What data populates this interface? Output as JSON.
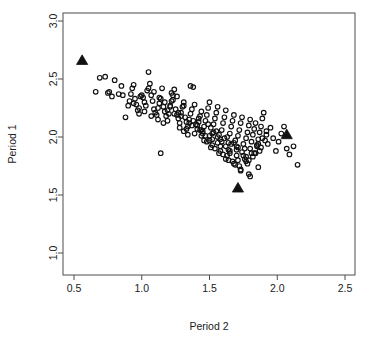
{
  "figure": {
    "background": "#ffffff",
    "frame_color": "#4d4d4d",
    "point_color": "#111111"
  },
  "chart_data": {
    "type": "scatter",
    "title": "",
    "xlabel": "Period 2",
    "ylabel": "Period 1",
    "xlim": [
      0.38,
      2.58
    ],
    "ylim": [
      0.92,
      3.08
    ],
    "xticks": [
      0.5,
      1.0,
      1.5,
      2.0,
      2.5
    ],
    "yticks": [
      1.0,
      1.5,
      2.0,
      2.5,
      3.0
    ],
    "xticklabels": [
      "0.5",
      "1.0",
      "1.5",
      "2.0",
      "2.5"
    ],
    "yticklabels": [
      "1.0",
      "1.5",
      "2.0",
      "2.5",
      "3.0"
    ],
    "grid": false,
    "legend": null,
    "series": [
      {
        "name": "observations",
        "marker": "open-circle",
        "marker_size": 4.6,
        "x": [
          0.66,
          0.69,
          0.73,
          0.75,
          0.76,
          0.78,
          0.8,
          0.83,
          0.85,
          0.86,
          0.88,
          0.9,
          0.91,
          0.92,
          0.93,
          0.94,
          0.95,
          0.96,
          0.97,
          0.98,
          0.99,
          1.0,
          1.01,
          1.02,
          1.03,
          1.04,
          1.05,
          1.06,
          1.07,
          1.08,
          1.09,
          1.1,
          1.11,
          1.12,
          1.13,
          1.14,
          1.15,
          1.16,
          1.17,
          1.18,
          1.19,
          1.2,
          1.21,
          1.22,
          1.23,
          1.24,
          1.25,
          1.26,
          1.27,
          1.28,
          1.29,
          1.3,
          1.31,
          1.32,
          1.33,
          1.34,
          1.35,
          1.36,
          1.37,
          1.38,
          1.39,
          1.4,
          1.41,
          1.42,
          1.43,
          1.44,
          1.45,
          1.46,
          1.47,
          1.48,
          1.49,
          1.5,
          1.51,
          1.52,
          1.53,
          1.54,
          1.55,
          1.56,
          1.57,
          1.58,
          1.59,
          1.6,
          1.61,
          1.62,
          1.63,
          1.64,
          1.65,
          1.66,
          1.67,
          1.68,
          1.69,
          1.7,
          1.71,
          1.72,
          1.73,
          1.74,
          1.75,
          1.76,
          1.77,
          1.78,
          1.79,
          1.8,
          1.81,
          1.82,
          1.83,
          1.84,
          1.85,
          1.86,
          1.87,
          1.88,
          1.89,
          1.9,
          1.91,
          1.92,
          1.93,
          1.95,
          1.97,
          1.99,
          2.01,
          2.03,
          2.05,
          2.07,
          2.09,
          2.12,
          2.15,
          1.14,
          1.36,
          1.05,
          1.22,
          1.26,
          0.94,
          0.98,
          1.02,
          1.07,
          1.12,
          1.16,
          1.19,
          1.24,
          1.28,
          1.31,
          1.34,
          1.38,
          1.41,
          1.44,
          1.47,
          1.5,
          1.53,
          1.56,
          1.59,
          1.62,
          1.65,
          1.68,
          1.71,
          1.74,
          1.77,
          1.8,
          1.83,
          1.86,
          1.89,
          1.92,
          1.23,
          1.31,
          1.42,
          1.49,
          1.55,
          1.61,
          1.66,
          1.7,
          1.75,
          1.79,
          1.84,
          1.88,
          1.52,
          1.58,
          1.63,
          1.67,
          1.72,
          1.76,
          1.81,
          1.85,
          1.44,
          1.48,
          1.54,
          1.6,
          1.64,
          1.69,
          1.73,
          1.78,
          1.82,
          1.87,
          1.33,
          1.39,
          1.46,
          1.51,
          1.57,
          1.62,
          1.68,
          1.73,
          1.79,
          1.86,
          1.09,
          1.17,
          1.27,
          1.35,
          1.43,
          1.5,
          1.56,
          1.64,
          1.7,
          1.77,
          1.13,
          1.21,
          1.29,
          1.37,
          1.45,
          1.52,
          1.58,
          1.65,
          1.71,
          1.8
        ],
        "y": [
          2.39,
          2.51,
          2.52,
          2.38,
          2.39,
          2.35,
          2.49,
          2.37,
          2.44,
          2.36,
          2.17,
          2.27,
          2.31,
          2.37,
          2.42,
          2.45,
          2.33,
          2.28,
          2.23,
          2.2,
          2.35,
          2.36,
          2.34,
          2.3,
          2.27,
          2.4,
          2.56,
          2.46,
          2.36,
          2.31,
          2.24,
          2.21,
          2.19,
          2.25,
          2.29,
          2.33,
          2.42,
          2.26,
          2.22,
          2.18,
          2.14,
          2.2,
          2.27,
          2.31,
          2.36,
          2.41,
          2.24,
          2.19,
          2.16,
          2.12,
          2.21,
          2.26,
          2.3,
          2.17,
          2.13,
          2.09,
          2.15,
          2.2,
          2.24,
          2.43,
          2.28,
          2.11,
          2.07,
          2.13,
          2.18,
          2.22,
          2.05,
          2.09,
          2.14,
          2.19,
          2.25,
          2.3,
          2.08,
          2.03,
          2.11,
          2.16,
          2.21,
          2.26,
          2.02,
          1.98,
          2.06,
          2.12,
          2.17,
          2.23,
          2.0,
          1.95,
          2.03,
          2.09,
          2.14,
          2.19,
          1.97,
          1.92,
          2.01,
          2.06,
          2.12,
          2.17,
          1.94,
          1.9,
          1.99,
          2.04,
          2.1,
          2.15,
          1.96,
          2.02,
          2.07,
          2.12,
          1.93,
          1.98,
          2.04,
          2.09,
          2.16,
          2.21,
          1.97,
          2.02,
          1.94,
          2.08,
          1.99,
          1.88,
          1.96,
          2.03,
          2.09,
          1.9,
          1.85,
          1.92,
          1.76,
          1.86,
          2.44,
          2.42,
          2.38,
          2.35,
          2.29,
          2.25,
          2.22,
          2.18,
          2.15,
          2.12,
          2.23,
          2.2,
          2.08,
          2.05,
          2.02,
          2.14,
          2.1,
          2.06,
          2.01,
          1.97,
          2.04,
          2.0,
          1.96,
          1.92,
          1.88,
          1.95,
          1.91,
          1.87,
          1.83,
          1.9,
          1.86,
          1.94,
          1.99,
          2.05,
          2.32,
          2.27,
          2.16,
          2.11,
          2.05,
          1.99,
          1.94,
          1.89,
          1.84,
          1.8,
          1.86,
          1.91,
          1.93,
          1.88,
          1.84,
          1.79,
          1.75,
          1.81,
          1.86,
          1.92,
          2.01,
          1.96,
          1.9,
          1.85,
          1.8,
          1.76,
          1.71,
          1.77,
          1.83,
          1.88,
          2.07,
          2.03,
          1.97,
          1.91,
          1.86,
          1.81,
          1.77,
          1.72,
          1.68,
          1.74,
          2.39,
          2.3,
          2.21,
          2.12,
          2.06,
          2.01,
          1.95,
          1.89,
          1.84,
          1.79,
          2.34,
          2.26,
          2.18,
          2.1,
          2.03,
          1.98,
          1.92,
          1.86,
          1.8,
          1.66
        ]
      },
      {
        "name": "highlighted",
        "marker": "filled-triangle",
        "marker_size": 9,
        "x": [
          0.56,
          2.07,
          1.71
        ],
        "y": [
          2.66,
          2.02,
          1.56
        ]
      }
    ]
  },
  "axes": {
    "x_title": "Period 2",
    "y_title": "Period 1"
  }
}
